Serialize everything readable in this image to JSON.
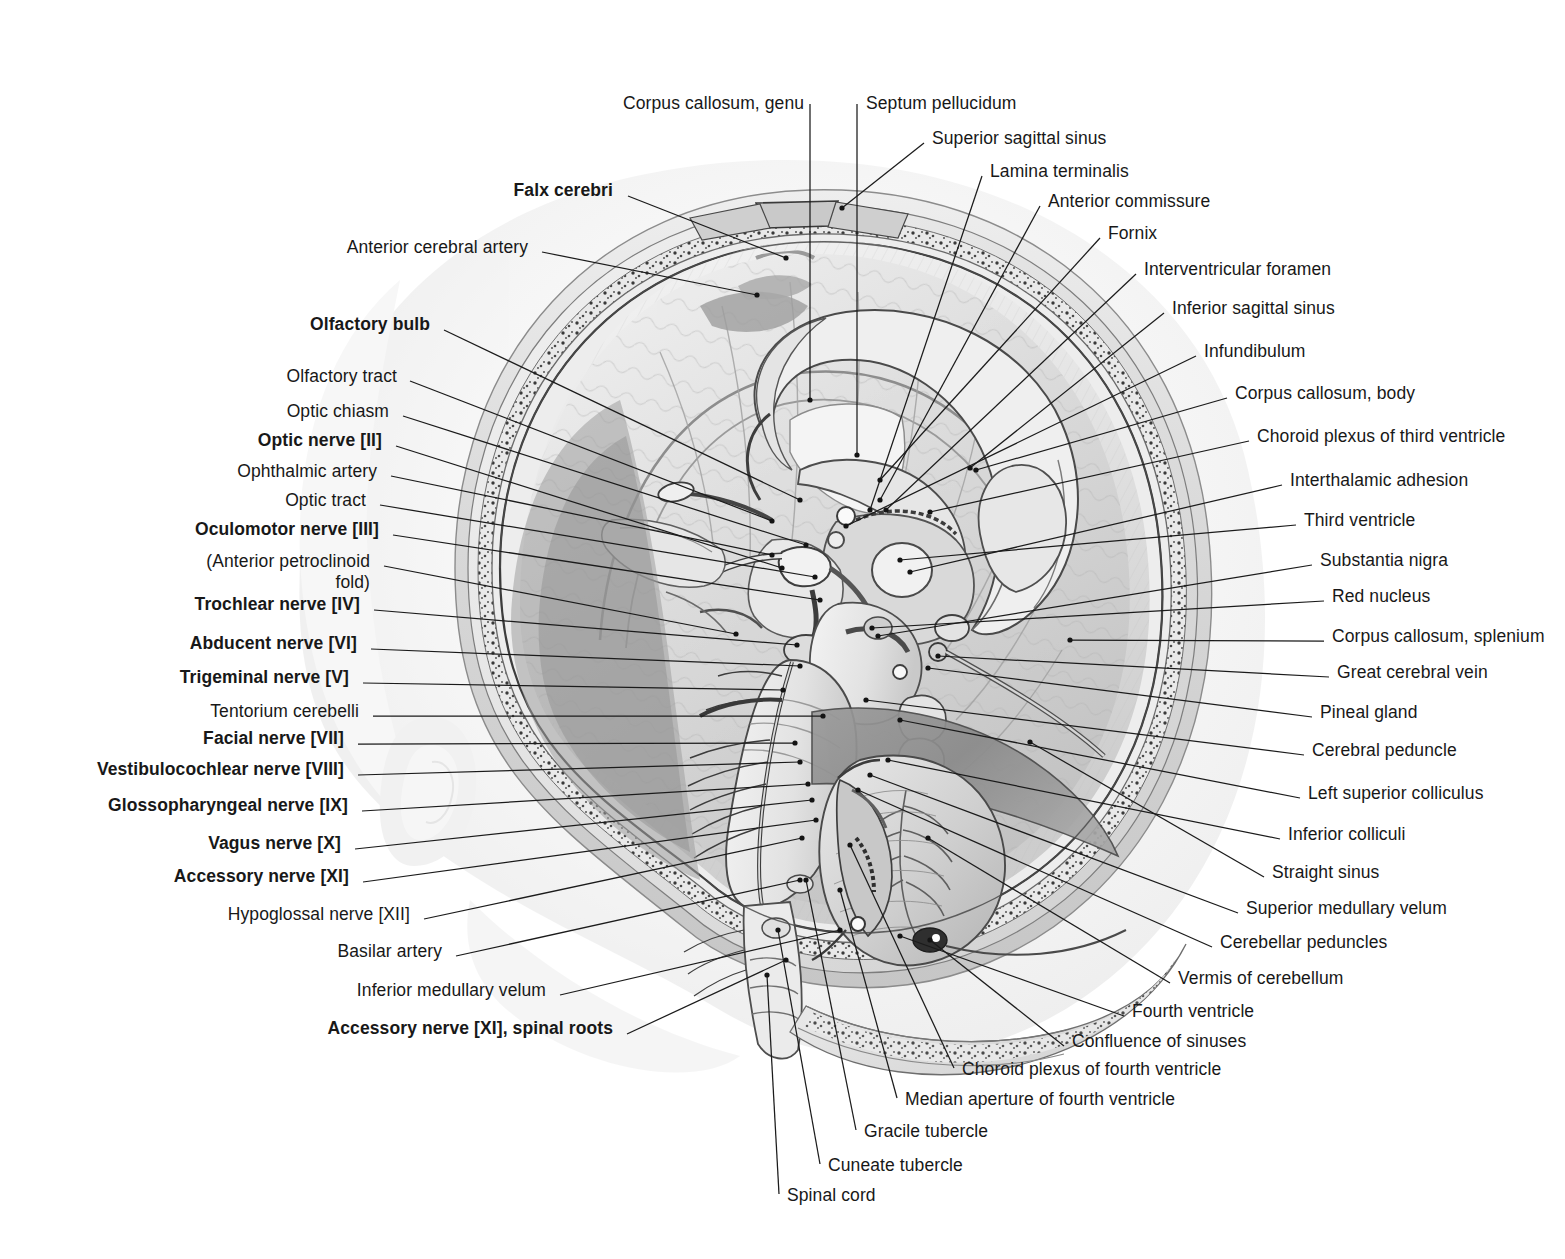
{
  "plate": {
    "title": "Median section of the brain in situ",
    "background_color": "#ffffff",
    "ink_color": "#181818",
    "leader_color": "#1b1b1b"
  },
  "labels_left": [
    {
      "text": "Falx cerebri",
      "bold": true,
      "x": 613,
      "y": 179,
      "align": "right",
      "lx": 628,
      "ly": 196,
      "tx": 786,
      "ty": 258
    },
    {
      "text": "Anterior cerebral artery",
      "bold": false,
      "x": 528,
      "y": 236,
      "align": "right",
      "lx": 542,
      "ly": 252,
      "tx": 757,
      "ty": 295
    },
    {
      "text": "Olfactory bulb",
      "bold": true,
      "x": 430,
      "y": 313,
      "align": "right",
      "lx": 444,
      "ly": 330,
      "tx": 800,
      "ty": 500
    },
    {
      "text": "Olfactory tract",
      "bold": false,
      "x": 397,
      "y": 365,
      "align": "right",
      "lx": 410,
      "ly": 381,
      "tx": 772,
      "ty": 521
    },
    {
      "text": "Optic chiasm",
      "bold": false,
      "x": 389,
      "y": 400,
      "align": "right",
      "lx": 403,
      "ly": 416,
      "tx": 806,
      "ty": 545
    },
    {
      "text": "Optic nerve [II]",
      "bold": true,
      "x": 382,
      "y": 429,
      "align": "right",
      "lx": 396,
      "ly": 446,
      "tx": 782,
      "ty": 568
    },
    {
      "text": "Ophthalmic artery",
      "bold": false,
      "x": 377,
      "y": 460,
      "align": "right",
      "lx": 391,
      "ly": 476,
      "tx": 772,
      "ty": 555
    },
    {
      "text": "Optic tract",
      "bold": false,
      "x": 366,
      "y": 489,
      "align": "right",
      "lx": 380,
      "ly": 505,
      "tx": 815,
      "ty": 577
    },
    {
      "text": "Oculomotor nerve [III]",
      "bold": true,
      "x": 379,
      "y": 518,
      "align": "right",
      "lx": 393,
      "ly": 535,
      "tx": 820,
      "ty": 600
    },
    {
      "text": "(Anterior petroclinoid",
      "bold": false,
      "x": 370,
      "y": 550,
      "align": "right",
      "lx": 384,
      "ly": 566,
      "tx": 736,
      "ty": 634
    },
    {
      "text": "fold)",
      "bold": false,
      "x": 370,
      "y": 571,
      "align": "right",
      "lx": -1,
      "ly": -1,
      "tx": -1,
      "ty": -1
    },
    {
      "text": "Trochlear nerve [IV]",
      "bold": true,
      "x": 360,
      "y": 593,
      "align": "right",
      "lx": 374,
      "ly": 610,
      "tx": 797,
      "ty": 645
    },
    {
      "text": "Abducent nerve [VI]",
      "bold": true,
      "x": 357,
      "y": 632,
      "align": "right",
      "lx": 371,
      "ly": 649,
      "tx": 800,
      "ty": 666
    },
    {
      "text": "Trigeminal nerve [V]",
      "bold": true,
      "x": 349,
      "y": 666,
      "align": "right",
      "lx": 363,
      "ly": 683,
      "tx": 783,
      "ty": 690
    },
    {
      "text": "Tentorium cerebelli",
      "bold": false,
      "x": 359,
      "y": 700,
      "align": "right",
      "lx": 373,
      "ly": 716,
      "tx": 823,
      "ty": 716
    },
    {
      "text": "Facial nerve [VII]",
      "bold": true,
      "x": 344,
      "y": 727,
      "align": "right",
      "lx": 358,
      "ly": 744,
      "tx": 795,
      "ty": 743
    },
    {
      "text": "Vestibulocochlear nerve [VIII]",
      "bold": true,
      "x": 344,
      "y": 758,
      "align": "right",
      "lx": 358,
      "ly": 775,
      "tx": 800,
      "ty": 762
    },
    {
      "text": "Glossopharyngeal nerve [IX]",
      "bold": true,
      "x": 348,
      "y": 794,
      "align": "right",
      "lx": 362,
      "ly": 811,
      "tx": 808,
      "ty": 784
    },
    {
      "text": "Vagus nerve [X]",
      "bold": true,
      "x": 341,
      "y": 832,
      "align": "right",
      "lx": 355,
      "ly": 849,
      "tx": 812,
      "ty": 800
    },
    {
      "text": "Accessory nerve [XI]",
      "bold": true,
      "x": 349,
      "y": 865,
      "align": "right",
      "lx": 363,
      "ly": 882,
      "tx": 816,
      "ty": 820
    },
    {
      "text": "Hypoglossal nerve [XII]",
      "bold": false,
      "x": 410,
      "y": 903,
      "align": "right",
      "lx": 424,
      "ly": 919,
      "tx": 802,
      "ty": 838
    },
    {
      "text": "Basilar artery",
      "bold": false,
      "x": 442,
      "y": 940,
      "align": "right",
      "lx": 456,
      "ly": 956,
      "tx": 800,
      "ty": 880
    },
    {
      "text": "Inferior medullary velum",
      "bold": false,
      "x": 546,
      "y": 979,
      "align": "right",
      "lx": 560,
      "ly": 995,
      "tx": 840,
      "ty": 930
    },
    {
      "text": "Accessory nerve [XI], spinal roots",
      "bold": true,
      "x": 613,
      "y": 1017,
      "align": "right",
      "lx": 627,
      "ly": 1034,
      "tx": 786,
      "ty": 960
    }
  ],
  "labels_top": [
    {
      "text": "Corpus callosum, genu",
      "bold": false,
      "x": 623,
      "y": 92,
      "align": "left",
      "lx": 810,
      "ly": 104,
      "tx": 810,
      "ty": 400
    },
    {
      "text": "Septum pellucidum",
      "bold": false,
      "x": 866,
      "y": 92,
      "align": "left",
      "lx": 857,
      "ly": 104,
      "tx": 857,
      "ty": 455
    }
  ],
  "labels_right": [
    {
      "text": "Superior sagittal sinus",
      "bold": false,
      "x": 932,
      "y": 127,
      "align": "left",
      "lx": 924,
      "ly": 143,
      "tx": 842,
      "ty": 208
    },
    {
      "text": "Lamina terminalis",
      "bold": false,
      "x": 990,
      "y": 160,
      "align": "left",
      "lx": 982,
      "ly": 176,
      "tx": 870,
      "ty": 510
    },
    {
      "text": "Anterior commissure",
      "bold": false,
      "x": 1048,
      "y": 190,
      "align": "left",
      "lx": 1040,
      "ly": 206,
      "tx": 880,
      "ty": 500
    },
    {
      "text": "Fornix",
      "bold": false,
      "x": 1108,
      "y": 222,
      "align": "left",
      "lx": 1100,
      "ly": 238,
      "tx": 880,
      "ty": 480
    },
    {
      "text": "Interventricular foramen",
      "bold": false,
      "x": 1144,
      "y": 258,
      "align": "left",
      "lx": 1136,
      "ly": 274,
      "tx": 886,
      "ty": 510
    },
    {
      "text": "Inferior sagittal sinus",
      "bold": false,
      "x": 1172,
      "y": 297,
      "align": "left",
      "lx": 1164,
      "ly": 313,
      "tx": 970,
      "ty": 468
    },
    {
      "text": "Infundibulum",
      "bold": false,
      "x": 1204,
      "y": 340,
      "align": "left",
      "lx": 1196,
      "ly": 356,
      "tx": 846,
      "ty": 526
    },
    {
      "text": "Corpus callosum, body",
      "bold": false,
      "x": 1235,
      "y": 382,
      "align": "left",
      "lx": 1227,
      "ly": 398,
      "tx": 976,
      "ty": 470
    },
    {
      "text": "Choroid plexus of third ventricle",
      "bold": false,
      "x": 1257,
      "y": 425,
      "align": "left",
      "lx": 1249,
      "ly": 441,
      "tx": 930,
      "ty": 512
    },
    {
      "text": "Interthalamic adhesion",
      "bold": false,
      "x": 1290,
      "y": 469,
      "align": "left",
      "lx": 1282,
      "ly": 485,
      "tx": 910,
      "ty": 572
    },
    {
      "text": "Third ventricle",
      "bold": false,
      "x": 1304,
      "y": 509,
      "align": "left",
      "lx": 1296,
      "ly": 525,
      "tx": 900,
      "ty": 560
    },
    {
      "text": "Substantia nigra",
      "bold": false,
      "x": 1320,
      "y": 549,
      "align": "left",
      "lx": 1312,
      "ly": 565,
      "tx": 878,
      "ty": 636
    },
    {
      "text": "Red nucleus",
      "bold": false,
      "x": 1332,
      "y": 585,
      "align": "left",
      "lx": 1324,
      "ly": 601,
      "tx": 872,
      "ty": 628
    },
    {
      "text": "Corpus callosum, splenium",
      "bold": false,
      "x": 1332,
      "y": 625,
      "align": "left",
      "lx": 1324,
      "ly": 641,
      "tx": 1070,
      "ty": 640
    },
    {
      "text": "Great cerebral vein",
      "bold": false,
      "x": 1337,
      "y": 661,
      "align": "left",
      "lx": 1329,
      "ly": 677,
      "tx": 938,
      "ty": 656
    },
    {
      "text": "Pineal gland",
      "bold": false,
      "x": 1320,
      "y": 701,
      "align": "left",
      "lx": 1312,
      "ly": 717,
      "tx": 928,
      "ty": 668
    },
    {
      "text": "Cerebral peduncle",
      "bold": false,
      "x": 1312,
      "y": 739,
      "align": "left",
      "lx": 1304,
      "ly": 755,
      "tx": 866,
      "ty": 700
    },
    {
      "text": "Left superior colliculus",
      "bold": false,
      "x": 1308,
      "y": 782,
      "align": "left",
      "lx": 1300,
      "ly": 798,
      "tx": 900,
      "ty": 720
    },
    {
      "text": "Inferior colliculi",
      "bold": false,
      "x": 1288,
      "y": 823,
      "align": "left",
      "lx": 1280,
      "ly": 839,
      "tx": 888,
      "ty": 760
    },
    {
      "text": "Straight sinus",
      "bold": false,
      "x": 1272,
      "y": 861,
      "align": "left",
      "lx": 1264,
      "ly": 877,
      "tx": 1030,
      "ty": 742
    },
    {
      "text": "Superior medullary velum",
      "bold": false,
      "x": 1246,
      "y": 897,
      "align": "left",
      "lx": 1238,
      "ly": 913,
      "tx": 870,
      "ty": 775
    },
    {
      "text": "Cerebellar peduncles",
      "bold": false,
      "x": 1220,
      "y": 931,
      "align": "left",
      "lx": 1212,
      "ly": 947,
      "tx": 858,
      "ty": 790
    },
    {
      "text": "Vermis of cerebellum",
      "bold": false,
      "x": 1178,
      "y": 967,
      "align": "left",
      "lx": 1170,
      "ly": 983,
      "tx": 928,
      "ty": 838
    },
    {
      "text": "Fourth ventricle",
      "bold": false,
      "x": 1132,
      "y": 1000,
      "align": "left",
      "lx": 1124,
      "ly": 1016,
      "tx": 900,
      "ty": 936
    },
    {
      "text": "Confluence of sinuses",
      "bold": false,
      "x": 1072,
      "y": 1030,
      "align": "left",
      "lx": 1064,
      "ly": 1046,
      "tx": 930,
      "ty": 940
    }
  ],
  "labels_bottom": [
    {
      "text": "Choroid plexus of fourth ventricle",
      "bold": false,
      "x": 962,
      "y": 1058,
      "align": "left",
      "lx": 954,
      "ly": 1068,
      "tx": 850,
      "ty": 845
    },
    {
      "text": "Median aperture of fourth ventricle",
      "bold": false,
      "x": 905,
      "y": 1088,
      "align": "left",
      "lx": 897,
      "ly": 1098,
      "tx": 840,
      "ty": 890
    },
    {
      "text": "Gracile tubercle",
      "bold": false,
      "x": 864,
      "y": 1120,
      "align": "left",
      "lx": 856,
      "ly": 1130,
      "tx": 806,
      "ty": 880
    },
    {
      "text": "Cuneate tubercle",
      "bold": false,
      "x": 828,
      "y": 1154,
      "align": "left",
      "lx": 820,
      "ly": 1164,
      "tx": 778,
      "ty": 930
    },
    {
      "text": "Spinal cord",
      "bold": false,
      "x": 787,
      "y": 1184,
      "align": "left",
      "lx": 779,
      "ly": 1194,
      "tx": 767,
      "ty": 975
    }
  ]
}
